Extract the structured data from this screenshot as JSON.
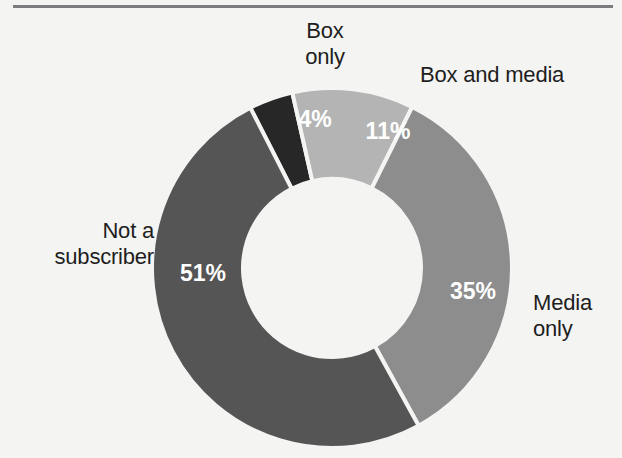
{
  "figure": {
    "name": "subscription-status-donut",
    "background_color": "#f4f4f2",
    "rule_color": "#6f7174"
  },
  "chart_data": {
    "type": "pie",
    "variant": "donut",
    "title": "",
    "subtitle": "",
    "xlabel": "",
    "ylabel": "",
    "units": "percent",
    "total": 101,
    "start_angle_deg": -27,
    "direction": "clockwise",
    "center": {
      "x": 332,
      "y": 268
    },
    "outer_radius": 180,
    "inner_radius": 89,
    "legend_position": "callouts",
    "grid": false,
    "categories": [
      "Box only",
      "Box and media",
      "Media only",
      "Not a subscriber"
    ],
    "values": [
      4,
      11,
      35,
      51
    ],
    "value_labels": [
      "4%",
      "11%",
      "35%",
      "51%"
    ],
    "colors": [
      "#272727",
      "#b4b4b4",
      "#8d8d8d",
      "#555555"
    ],
    "slices": [
      {
        "name": "box-only",
        "label": "Box\nonly",
        "value": 4,
        "value_label": "4%",
        "color": "#272727",
        "label_x": 315,
        "label_y": 121
      },
      {
        "name": "box-and-media",
        "label": "Box and media",
        "value": 11,
        "value_label": "11%",
        "color": "#b4b4b4",
        "label_x": 388,
        "label_y": 133
      },
      {
        "name": "media-only",
        "label": "Media\nonly",
        "value": 35,
        "value_label": "35%",
        "color": "#8d8d8d",
        "label_x": 473,
        "label_y": 293
      },
      {
        "name": "not-a-subscriber",
        "label": "Not a\nsubscriber",
        "value": 51,
        "value_label": "51%",
        "color": "#555555",
        "label_x": 203,
        "label_y": 275
      }
    ]
  },
  "callouts": {
    "box_only": "Box\nonly",
    "box_and_media": "Box and media",
    "media_only": "Media\nonly",
    "not_a_subscriber": "Not a\nsubscriber"
  }
}
